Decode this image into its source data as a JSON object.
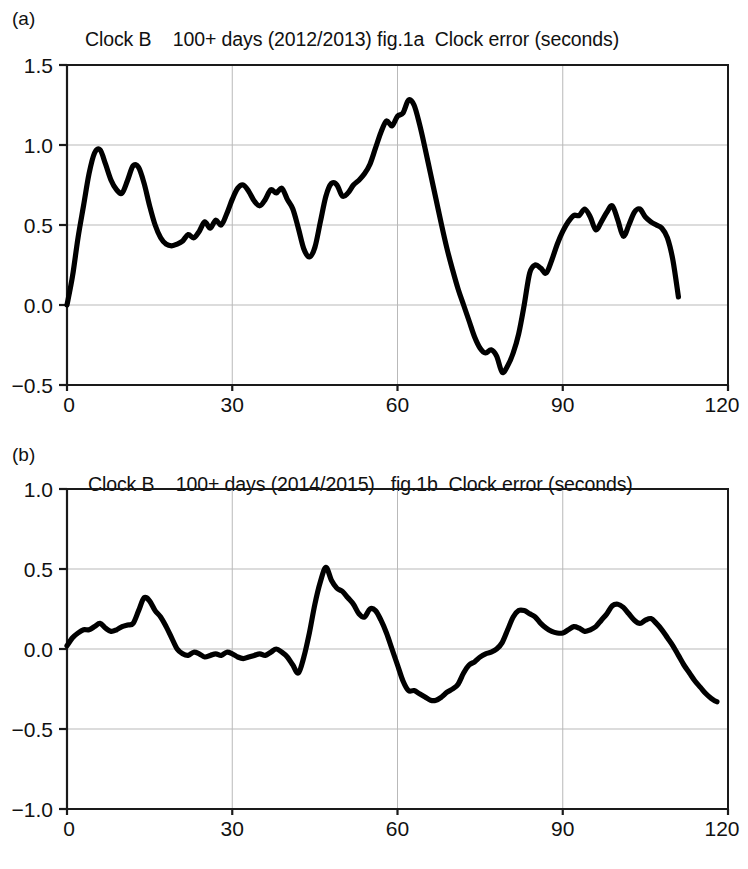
{
  "figure": {
    "panels": [
      {
        "letter": "(a)",
        "title": "Clock B    100+ days (2012/2013) fig.1a  Clock error (seconds)"
      },
      {
        "letter": "(b)",
        "title": "Clock B    100+ days (2014/2015)   fig.1b  Clock error (seconds)"
      }
    ]
  },
  "chart_data": [
    {
      "type": "line",
      "panel": "(a)",
      "title": "Clock B    100+ days (2012/2013) fig.1a  Clock error (seconds)",
      "xlabel": "",
      "ylabel": "",
      "xlim": [
        0,
        120
      ],
      "ylim": [
        -0.5,
        1.5
      ],
      "xticks": [
        0,
        30,
        60,
        90,
        120
      ],
      "xtick_labels": [
        "0",
        "30",
        "60",
        "90",
        "120"
      ],
      "yticks": [
        -0.5,
        0.0,
        0.5,
        1.0,
        1.5
      ],
      "ytick_labels": [
        "-0.5",
        "0.0",
        "0.5",
        "1.0",
        "1.5"
      ],
      "grid": true,
      "legend": false,
      "line_color": "#000000",
      "series": [
        {
          "name": "Clock error 2012/2013",
          "x": [
            0,
            1,
            2,
            3,
            4,
            5,
            6,
            7,
            8,
            9,
            10,
            11,
            12,
            13,
            14,
            15,
            16,
            17,
            18,
            19,
            20,
            21,
            22,
            23,
            24,
            25,
            26,
            27,
            28,
            29,
            30,
            31,
            32,
            33,
            34,
            35,
            36,
            37,
            38,
            39,
            40,
            41,
            42,
            43,
            44,
            45,
            46,
            47,
            48,
            49,
            50,
            51,
            52,
            53,
            54,
            55,
            56,
            57,
            58,
            59,
            60,
            61,
            62,
            63,
            64,
            65,
            66,
            67,
            68,
            69,
            70,
            71,
            72,
            73,
            74,
            75,
            76,
            77,
            78,
            79,
            80,
            81,
            82,
            83,
            84,
            85,
            86,
            87,
            88,
            89,
            90,
            91,
            92,
            93,
            94,
            95,
            96,
            97,
            98,
            99,
            100,
            101,
            102,
            103,
            104,
            105,
            106,
            107,
            108,
            109,
            110,
            111
          ],
          "y": [
            0.0,
            0.18,
            0.42,
            0.62,
            0.82,
            0.95,
            0.97,
            0.88,
            0.78,
            0.72,
            0.7,
            0.78,
            0.87,
            0.86,
            0.76,
            0.62,
            0.5,
            0.42,
            0.38,
            0.37,
            0.38,
            0.4,
            0.44,
            0.42,
            0.46,
            0.52,
            0.48,
            0.53,
            0.5,
            0.57,
            0.66,
            0.73,
            0.75,
            0.71,
            0.65,
            0.62,
            0.66,
            0.72,
            0.7,
            0.73,
            0.66,
            0.6,
            0.48,
            0.35,
            0.3,
            0.36,
            0.52,
            0.68,
            0.76,
            0.75,
            0.68,
            0.7,
            0.75,
            0.78,
            0.82,
            0.88,
            0.98,
            1.08,
            1.15,
            1.12,
            1.18,
            1.2,
            1.28,
            1.25,
            1.13,
            0.98,
            0.82,
            0.66,
            0.5,
            0.35,
            0.22,
            0.1,
            0.0,
            -0.1,
            -0.2,
            -0.27,
            -0.3,
            -0.28,
            -0.32,
            -0.42,
            -0.38,
            -0.3,
            -0.18,
            0.0,
            0.2,
            0.25,
            0.23,
            0.2,
            0.28,
            0.38,
            0.46,
            0.52,
            0.56,
            0.56,
            0.6,
            0.55,
            0.47,
            0.52,
            0.58,
            0.62,
            0.53,
            0.43,
            0.5,
            0.58,
            0.6,
            0.55,
            0.52,
            0.5,
            0.48,
            0.42,
            0.28,
            0.05
          ]
        }
      ]
    },
    {
      "type": "line",
      "panel": "(b)",
      "title": "Clock B    100+ days (2014/2015)   fig.1b  Clock error (seconds)",
      "xlabel": "",
      "ylabel": "",
      "xlim": [
        0,
        120
      ],
      "ylim": [
        -1.0,
        1.0
      ],
      "xticks": [
        0,
        30,
        60,
        90,
        120
      ],
      "xtick_labels": [
        "0",
        "30",
        "60",
        "90",
        "120"
      ],
      "yticks": [
        -1.0,
        -0.5,
        0.0,
        0.5,
        1.0
      ],
      "ytick_labels": [
        "-1.0",
        "-0.5",
        "0.0",
        "0.5",
        "1.0"
      ],
      "grid": true,
      "legend": false,
      "line_color": "#000000",
      "series": [
        {
          "name": "Clock error 2014/2015",
          "x": [
            0,
            1,
            2,
            3,
            4,
            5,
            6,
            7,
            8,
            9,
            10,
            11,
            12,
            13,
            14,
            15,
            16,
            17,
            18,
            19,
            20,
            21,
            22,
            23,
            24,
            25,
            26,
            27,
            28,
            29,
            30,
            31,
            32,
            33,
            34,
            35,
            36,
            37,
            38,
            39,
            40,
            41,
            42,
            43,
            44,
            45,
            46,
            47,
            48,
            49,
            50,
            51,
            52,
            53,
            54,
            55,
            56,
            57,
            58,
            59,
            60,
            61,
            62,
            63,
            64,
            65,
            66,
            67,
            68,
            69,
            70,
            71,
            72,
            73,
            74,
            75,
            76,
            77,
            78,
            79,
            80,
            81,
            82,
            83,
            84,
            85,
            86,
            87,
            88,
            89,
            90,
            91,
            92,
            93,
            94,
            95,
            96,
            97,
            98,
            99,
            100,
            101,
            102,
            103,
            104,
            105,
            106,
            107,
            108,
            109,
            110,
            111,
            112,
            113,
            114,
            115,
            116,
            117,
            118,
            119,
            120
          ],
          "y": [
            0.02,
            0.07,
            0.1,
            0.12,
            0.12,
            0.14,
            0.16,
            0.13,
            0.11,
            0.12,
            0.14,
            0.15,
            0.16,
            0.24,
            0.32,
            0.3,
            0.24,
            0.2,
            0.14,
            0.07,
            0.0,
            -0.03,
            -0.04,
            -0.02,
            -0.03,
            -0.05,
            -0.04,
            -0.03,
            -0.04,
            -0.02,
            -0.03,
            -0.05,
            -0.06,
            -0.05,
            -0.04,
            -0.03,
            -0.04,
            -0.02,
            0.0,
            -0.02,
            -0.05,
            -0.1,
            -0.15,
            -0.05,
            0.1,
            0.28,
            0.42,
            0.51,
            0.43,
            0.38,
            0.36,
            0.32,
            0.28,
            0.22,
            0.2,
            0.25,
            0.24,
            0.18,
            0.1,
            0.0,
            -0.1,
            -0.2,
            -0.26,
            -0.26,
            -0.28,
            -0.3,
            -0.32,
            -0.32,
            -0.3,
            -0.27,
            -0.25,
            -0.22,
            -0.15,
            -0.1,
            -0.08,
            -0.05,
            -0.03,
            -0.02,
            0.0,
            0.04,
            0.12,
            0.2,
            0.24,
            0.24,
            0.22,
            0.2,
            0.16,
            0.13,
            0.11,
            0.1,
            0.1,
            0.12,
            0.14,
            0.13,
            0.11,
            0.12,
            0.14,
            0.18,
            0.22,
            0.27,
            0.28,
            0.26,
            0.22,
            0.18,
            0.16,
            0.18,
            0.19,
            0.16,
            0.12,
            0.07,
            0.02,
            -0.04,
            -0.1,
            -0.15,
            -0.2,
            -0.24,
            -0.28,
            -0.31,
            -0.33,
            -0.33
          ]
        }
      ]
    }
  ]
}
